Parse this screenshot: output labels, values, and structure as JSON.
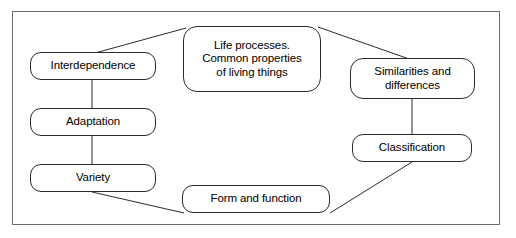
{
  "diagram": {
    "type": "concept-map",
    "frame": {
      "border_color": "#6e6e6e",
      "background": "#ffffff"
    },
    "node_style": {
      "border_color": "#2b2b2b",
      "fill": "#ffffff",
      "text_color": "#000000"
    },
    "nodes": [
      {
        "id": "life_processes",
        "label": "Life processes.\nCommon properties\nof living things"
      },
      {
        "id": "interdependence",
        "label": "Interdependence"
      },
      {
        "id": "adaptation",
        "label": "Adaptation"
      },
      {
        "id": "variety",
        "label": "Variety"
      },
      {
        "id": "similarities",
        "label": "Similarities and\ndifferences"
      },
      {
        "id": "classification",
        "label": "Classification"
      },
      {
        "id": "form_function",
        "label": "Form and function"
      }
    ],
    "edges": [
      {
        "from": "life_processes",
        "to": "interdependence",
        "style": "diagonal"
      },
      {
        "from": "life_processes",
        "to": "similarities",
        "style": "diagonal"
      },
      {
        "from": "interdependence",
        "to": "adaptation",
        "style": "vertical"
      },
      {
        "from": "adaptation",
        "to": "variety",
        "style": "vertical"
      },
      {
        "from": "similarities",
        "to": "classification",
        "style": "vertical"
      },
      {
        "from": "variety",
        "to": "form_function",
        "style": "diagonal"
      },
      {
        "from": "classification",
        "to": "form_function",
        "style": "diagonal"
      }
    ]
  }
}
